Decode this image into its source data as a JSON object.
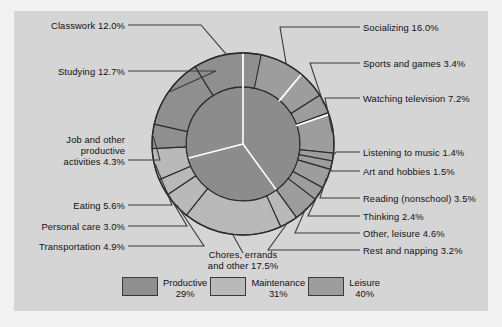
{
  "chart_data": {
    "type": "pie",
    "title": "",
    "subtitle": "",
    "xlabel": "",
    "ylabel": "",
    "legend_position": "bottom",
    "grid": false,
    "inner_ring": {
      "name": "Broad activity groups",
      "categories": [
        "Productive",
        "Maintenance",
        "Leisure"
      ],
      "values": [
        29,
        31,
        40
      ],
      "colors": [
        "#8f8f8f",
        "#b9b9b9",
        "#9d9d9d"
      ]
    },
    "outer_ring": {
      "name": "Detailed activities",
      "categories": [
        "Socializing",
        "Sports and games",
        "Watching television",
        "Listening to music",
        "Art and hobbies",
        "Reading (nonschool)",
        "Thinking",
        "Other, leisure",
        "Rest and napping",
        "Chores, errands and other",
        "Transportation",
        "Personal care",
        "Eating",
        "Job and other productive activities",
        "Studying",
        "Classwork"
      ],
      "values": [
        16.0,
        3.4,
        7.2,
        1.4,
        1.5,
        3.5,
        2.4,
        4.6,
        3.2,
        17.5,
        4.9,
        3.0,
        5.6,
        4.3,
        12.7,
        12.0
      ],
      "groups": [
        "Leisure",
        "Leisure",
        "Leisure",
        "Leisure",
        "Leisure",
        "Leisure",
        "Leisure",
        "Leisure",
        "Maintenance",
        "Maintenance",
        "Maintenance",
        "Maintenance",
        "Maintenance",
        "Productive",
        "Productive",
        "Productive"
      ]
    }
  },
  "labels": {
    "classwork": "Classwork 12.0%",
    "studying": "Studying 12.7%",
    "job_line1": "Job and other",
    "job_line2": "productive",
    "job_line3": "activities 4.3%",
    "eating": "Eating 5.6%",
    "personal_care": "Personal care 3.0%",
    "transportation": "Transportation 4.9%",
    "chores_line1": "Chores, errands",
    "chores_line2": "and other 17.5%",
    "socializing": "Socializing 16.0%",
    "sports": "Sports and games 3.4%",
    "television": "Watching television 7.2%",
    "music": "Listening to music 1.4%",
    "art": "Art and hobbies 1.5%",
    "reading": "Reading (nonschool) 3.5%",
    "thinking": "Thinking 2.4%",
    "other_leisure": "Other, leisure 4.6%",
    "rest": "Rest and napping 3.2%"
  },
  "legend": {
    "items": [
      {
        "label": "Productive",
        "percent": "29%",
        "color": "#8f8f8f"
      },
      {
        "label": "Maintenance",
        "percent": "31%",
        "color": "#b9b9b9"
      },
      {
        "label": "Leisure",
        "percent": "40%",
        "color": "#9d9d9d"
      }
    ]
  },
  "colors": {
    "background": "#f2f2f2",
    "panel": "#d5d5d5",
    "productive": "#8f8f8f",
    "maintenance": "#b9b9b9",
    "leisure": "#9d9d9d",
    "inner_productive": "#8c8c8c",
    "inner_maintenance": "#8c8c8c",
    "inner_leisure": "#8c8c8c",
    "stroke": "#2b2b2b",
    "group_divider": "#ffffff",
    "text": "#111111"
  }
}
